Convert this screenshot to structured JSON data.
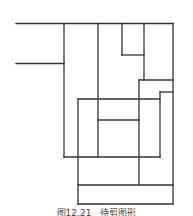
{
  "diagram": {
    "stroke": "#333333",
    "stroke_width": 1.3,
    "lines": [
      [
        16,
        23.5,
        173,
        23.5
      ],
      [
        16,
        63.5,
        64,
        63.5
      ],
      [
        64,
        23.5,
        64,
        157
      ],
      [
        98,
        23.5,
        98,
        157
      ],
      [
        122,
        23.5,
        122,
        55
      ],
      [
        122,
        55,
        144,
        55
      ],
      [
        144,
        23.5,
        144,
        80
      ],
      [
        173,
        23.5,
        173,
        204
      ],
      [
        139,
        80,
        173,
        80
      ],
      [
        139,
        80,
        139,
        185
      ],
      [
        160,
        92,
        173,
        92
      ],
      [
        160,
        92,
        160,
        157
      ],
      [
        78,
        99,
        160,
        99
      ],
      [
        78,
        99,
        78,
        204
      ],
      [
        98,
        120,
        139,
        120
      ],
      [
        64,
        157,
        160,
        157
      ],
      [
        78,
        185,
        173,
        185
      ],
      [
        78,
        204,
        173,
        204
      ]
    ]
  },
  "caption": "图12.21　待剪图形"
}
